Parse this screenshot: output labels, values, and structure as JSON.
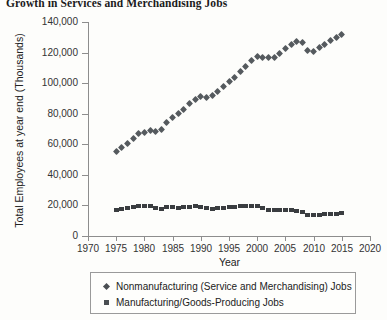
{
  "chart_data": {
    "type": "scatter",
    "title": "Growth in Services and Merchandising Jobs",
    "xlabel": "Year",
    "ylabel": "Total Employees at year end (Thousands)",
    "xlim": [
      1970,
      2020
    ],
    "ylim": [
      0,
      140000
    ],
    "xticks": [
      1970,
      1975,
      1980,
      1985,
      1990,
      1995,
      2000,
      2005,
      2010,
      2015,
      2020
    ],
    "xtick_labels": [
      "1970",
      "1975",
      "1980",
      "1985",
      "1990",
      "1995",
      "2000",
      "2005",
      "2010",
      "2015",
      "2020"
    ],
    "yticks": [
      0,
      20000,
      40000,
      60000,
      80000,
      100000,
      120000,
      140000
    ],
    "ytick_labels": [
      "0",
      "20,000",
      "40,000",
      "60,000",
      "80,000",
      "100,000",
      "120,000",
      "140,000"
    ],
    "grid": false,
    "legend_position": "below-axes",
    "x": [
      1975,
      1976,
      1977,
      1978,
      1979,
      1980,
      1981,
      1982,
      1983,
      1984,
      1985,
      1986,
      1987,
      1988,
      1989,
      1990,
      1991,
      1992,
      1993,
      1994,
      1995,
      1996,
      1997,
      1998,
      1999,
      2000,
      2001,
      2002,
      2003,
      2004,
      2005,
      2006,
      2007,
      2008,
      2009,
      2010,
      2011,
      2012,
      2013,
      2014,
      2015
    ],
    "series": [
      {
        "name": "Nonmanufacturing (Service and Merchandising) Jobs",
        "marker": "diamond",
        "color": "#555a5e",
        "values": [
          55500,
          58000,
          60500,
          64000,
          67000,
          68000,
          69000,
          68500,
          70000,
          74000,
          77500,
          80000,
          83000,
          86500,
          89500,
          91000,
          90500,
          92000,
          94500,
          98000,
          101000,
          104000,
          107500,
          111000,
          114500,
          117500,
          117000,
          116500,
          117000,
          119500,
          122500,
          125500,
          127500,
          126500,
          121500,
          121000,
          123000,
          125500,
          128000,
          130000,
          132000
        ]
      },
      {
        "name": "Manufacturing/Goods-Producing Jobs",
        "marker": "square",
        "color": "#3a3d40",
        "values": [
          16800,
          17500,
          18200,
          19200,
          19800,
          19500,
          19400,
          18000,
          17900,
          18800,
          18700,
          18600,
          18800,
          19200,
          19300,
          19000,
          18100,
          17900,
          18000,
          18400,
          18800,
          18900,
          19300,
          19500,
          19400,
          19300,
          18300,
          17200,
          16800,
          16700,
          16800,
          16900,
          16600,
          15900,
          14000,
          13700,
          13900,
          14100,
          14300,
          14600,
          14900
        ]
      }
    ]
  },
  "legend": {
    "entries": [
      {
        "label": "Nonmanufacturing (Service and Merchandising) Jobs",
        "marker": "diamond"
      },
      {
        "label": "Manufacturing/Goods-Producing Jobs",
        "marker": "square"
      }
    ]
  }
}
